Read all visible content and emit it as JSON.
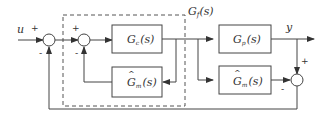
{
  "diagram": {
    "type": "internal-model-control-block-diagram",
    "input": {
      "label": "u"
    },
    "output": {
      "label": "y"
    },
    "group": {
      "label": "G_f(s)",
      "display": "Gf(s)"
    },
    "blocks": [
      {
        "id": "gc",
        "label": "G",
        "sub": "c",
        "arg": "(s)",
        "hat": false
      },
      {
        "id": "gm_inner",
        "label": "G",
        "sub": "m",
        "arg": "(s)",
        "hat": true
      },
      {
        "id": "gp",
        "label": "G",
        "sub": "p",
        "arg": "(s)",
        "hat": false
      },
      {
        "id": "gm_outer",
        "label": "G",
        "sub": "m",
        "arg": "(s)",
        "hat": true
      }
    ],
    "summing_junctions": [
      {
        "id": "s1",
        "signs": [
          "+",
          "-"
        ]
      },
      {
        "id": "s2",
        "signs": [
          "+",
          "-"
        ]
      },
      {
        "id": "s3",
        "signs": [
          "+",
          "-"
        ]
      }
    ],
    "signs": {
      "plus": "+",
      "minus": "-"
    },
    "hat": "^",
    "colors": {
      "line": "#444444",
      "text": "#333333",
      "background": "#ffffff"
    }
  }
}
